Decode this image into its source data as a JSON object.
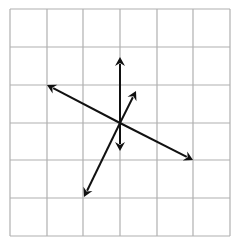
{
  "diagram": {
    "type": "vector-grid",
    "grid": {
      "columns": 6,
      "rows": 6,
      "x_lines": [
        10,
        47,
        83,
        120,
        157,
        193,
        230
      ],
      "y_lines": [
        9,
        47,
        85,
        123,
        160,
        198,
        236
      ],
      "line_color": "#b0b0b0"
    },
    "origin": {
      "x": 120,
      "y": 123
    },
    "arrow_color": "#111111",
    "arrows": [
      {
        "name": "vertical-up",
        "from": [
          120,
          123
        ],
        "to": [
          120,
          57
        ]
      },
      {
        "name": "vertical-down",
        "from": [
          120,
          123
        ],
        "to": [
          120,
          151
        ]
      },
      {
        "name": "upper-left",
        "from": [
          120,
          123
        ],
        "to": [
          47,
          85
        ]
      },
      {
        "name": "lower-right",
        "from": [
          120,
          123
        ],
        "to": [
          193,
          160
        ]
      },
      {
        "name": "upper-right",
        "from": [
          120,
          123
        ],
        "to": [
          136,
          91
        ]
      },
      {
        "name": "lower-left",
        "from": [
          120,
          123
        ],
        "to": [
          84,
          197
        ]
      }
    ]
  }
}
